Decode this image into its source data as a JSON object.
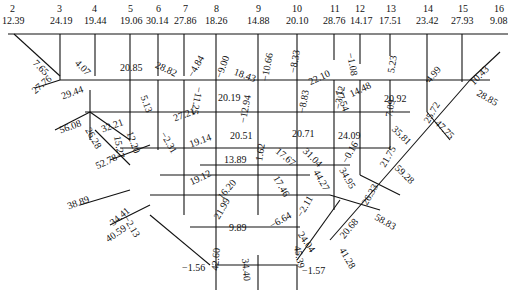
{
  "top_nodes": [
    {
      "id": "2",
      "value": "12.39",
      "x": 14
    },
    {
      "id": "3",
      "value": "24.19",
      "x": 60
    },
    {
      "id": "4",
      "value": "19.44",
      "x": 95
    },
    {
      "id": "5",
      "value": "19.06",
      "x": 130
    },
    {
      "id": "6",
      "value": "30.14",
      "x": 158
    },
    {
      "id": "7",
      "value": "27.86",
      "x": 184
    },
    {
      "id": "8",
      "value": "18.26",
      "x": 216
    },
    {
      "id": "9",
      "value": "14.88",
      "x": 258
    },
    {
      "id": "10",
      "value": "20.10",
      "x": 297
    },
    {
      "id": "11",
      "value": "28.76",
      "x": 334
    },
    {
      "id": "12",
      "value": "14.17",
      "x": 360
    },
    {
      "id": "13",
      "value": "17.51",
      "x": 390
    },
    {
      "id": "14",
      "value": "23.42",
      "x": 427
    },
    {
      "id": "15",
      "value": "27.93",
      "x": 462
    },
    {
      "id": "16",
      "value": "9.08",
      "x": 498
    }
  ],
  "member_labels": [
    {
      "text": "7.65",
      "x": 38,
      "y": 58,
      "rot": 45
    },
    {
      "text": "27.76",
      "x": 30,
      "y": 82,
      "rot": -40
    },
    {
      "text": "4.07",
      "x": 77,
      "y": 62,
      "rot": 45
    },
    {
      "text": "29.44",
      "x": 60,
      "y": 90,
      "rot": -20
    },
    {
      "text": "20.85",
      "x": 120,
      "y": 65,
      "rot": 0
    },
    {
      "text": "28.82",
      "x": 158,
      "y": 60,
      "rot": 25
    },
    {
      "text": "−4.84",
      "x": 184,
      "y": 70,
      "rot": -60
    },
    {
      "text": "−9.00",
      "x": 213,
      "y": 72,
      "rot": -70
    },
    {
      "text": "18.43",
      "x": 236,
      "y": 68,
      "rot": 20
    },
    {
      "text": "−10.66",
      "x": 262,
      "y": 78,
      "rot": -80
    },
    {
      "text": "−8.33",
      "x": 288,
      "y": 70,
      "rot": -80
    },
    {
      "text": "22.10",
      "x": 307,
      "y": 74,
      "rot": -25
    },
    {
      "text": "−1.08",
      "x": 350,
      "y": 62,
      "rot": 80
    },
    {
      "text": "5.23",
      "x": 386,
      "y": 68,
      "rot": -80
    },
    {
      "text": "4.99",
      "x": 424,
      "y": 77,
      "rot": -50
    },
    {
      "text": "10.43",
      "x": 470,
      "y": 78,
      "rot": -45
    },
    {
      "text": "56.08",
      "x": 60,
      "y": 125,
      "rot": -20
    },
    {
      "text": "26.28",
      "x": 90,
      "y": 128,
      "rot": 60
    },
    {
      "text": "32.21",
      "x": 100,
      "y": 123,
      "rot": -20
    },
    {
      "text": "12.20",
      "x": 130,
      "y": 132,
      "rot": 70
    },
    {
      "text": "15.27",
      "x": 118,
      "y": 135,
      "rot": 80
    },
    {
      "text": "5.13",
      "x": 143,
      "y": 97,
      "rot": 70
    },
    {
      "text": "27.21",
      "x": 173,
      "y": 113,
      "rot": -20
    },
    {
      "text": "−11.25",
      "x": 200,
      "y": 92,
      "rot": 100
    },
    {
      "text": "20.19",
      "x": 218,
      "y": 95,
      "rot": 0
    },
    {
      "text": "−2.31",
      "x": 162,
      "y": 133,
      "rot": 60
    },
    {
      "text": "19.14",
      "x": 190,
      "y": 137,
      "rot": -20
    },
    {
      "text": "−12.94",
      "x": 240,
      "y": 121,
      "rot": -80
    },
    {
      "text": "−8.83",
      "x": 300,
      "y": 110,
      "rot": -80
    },
    {
      "text": "−3.12",
      "x": 335,
      "y": 105,
      "rot": -80
    },
    {
      "text": "27.54",
      "x": 340,
      "y": 90,
      "rot": 70
    },
    {
      "text": "14.48",
      "x": 348,
      "y": 88,
      "rot": -25
    },
    {
      "text": "20.92",
      "x": 385,
      "y": 96,
      "rot": 0
    },
    {
      "text": "7.09",
      "x": 386,
      "y": 113,
      "rot": -80
    },
    {
      "text": "25.72",
      "x": 424,
      "y": 117,
      "rot": -60
    },
    {
      "text": "35.81",
      "x": 394,
      "y": 130,
      "rot": 45
    },
    {
      "text": "47.75",
      "x": 438,
      "y": 122,
      "rot": 45
    },
    {
      "text": "28.85",
      "x": 478,
      "y": 93,
      "rot": 30
    },
    {
      "text": "52.78",
      "x": 96,
      "y": 160,
      "rot": -25
    },
    {
      "text": "20.51",
      "x": 230,
      "y": 133,
      "rot": 0
    },
    {
      "text": "20.71",
      "x": 292,
      "y": 131,
      "rot": 0
    },
    {
      "text": "24.09",
      "x": 338,
      "y": 133,
      "rot": 0
    },
    {
      "text": "−0.16",
      "x": 340,
      "y": 158,
      "rot": -60
    },
    {
      "text": "21.75",
      "x": 380,
      "y": 162,
      "rot": -60
    },
    {
      "text": "59.28",
      "x": 398,
      "y": 168,
      "rot": 45
    },
    {
      "text": "13.89",
      "x": 224,
      "y": 157,
      "rot": 0
    },
    {
      "text": "1.62",
      "x": 255,
      "y": 158,
      "rot": -80
    },
    {
      "text": "17.67",
      "x": 278,
      "y": 150,
      "rot": 40
    },
    {
      "text": "31.04",
      "x": 306,
      "y": 150,
      "rot": 45
    },
    {
      "text": "19.12",
      "x": 190,
      "y": 175,
      "rot": -25
    },
    {
      "text": "16.20",
      "x": 218,
      "y": 193,
      "rot": -50
    },
    {
      "text": "17.46",
      "x": 275,
      "y": 178,
      "rot": 60
    },
    {
      "text": "44.27",
      "x": 318,
      "y": 172,
      "rot": 60
    },
    {
      "text": "34.95",
      "x": 342,
      "y": 172,
      "rot": 60
    },
    {
      "text": "26.33",
      "x": 360,
      "y": 200,
      "rot": -60
    },
    {
      "text": "58.83",
      "x": 376,
      "y": 216,
      "rot": 30
    },
    {
      "text": "38.89",
      "x": 67,
      "y": 200,
      "rot": -20
    },
    {
      "text": "34.41",
      "x": 110,
      "y": 215,
      "rot": -40
    },
    {
      "text": "−2.13",
      "x": 127,
      "y": 220,
      "rot": 60
    },
    {
      "text": "40.59",
      "x": 106,
      "y": 232,
      "rot": -35
    },
    {
      "text": "21.99",
      "x": 214,
      "y": 213,
      "rot": -60
    },
    {
      "text": "−6.64",
      "x": 268,
      "y": 220,
      "rot": -30
    },
    {
      "text": "−2.11",
      "x": 296,
      "y": 212,
      "rot": -60
    },
    {
      "text": "20.68",
      "x": 339,
      "y": 231,
      "rot": -50
    },
    {
      "text": "24.04",
      "x": 300,
      "y": 235,
      "rot": 55
    },
    {
      "text": "41.28",
      "x": 343,
      "y": 250,
      "rot": 60
    },
    {
      "text": "9.89",
      "x": 230,
      "y": 225,
      "rot": 0
    },
    {
      "text": "42.60",
      "x": 212,
      "y": 266,
      "rot": -85
    },
    {
      "text": "34.40",
      "x": 245,
      "y": 263,
      "rot": 85
    },
    {
      "text": "45.39",
      "x": 296,
      "y": 250,
      "rot": 80
    },
    {
      "text": "−1.56",
      "x": 182,
      "y": 265,
      "rot": 0
    },
    {
      "text": "−1.57",
      "x": 302,
      "y": 268,
      "rot": 0
    }
  ]
}
